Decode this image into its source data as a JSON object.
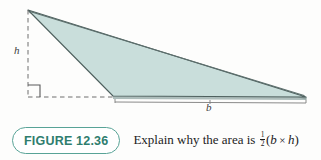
{
  "figure": {
    "type": "geometry-diagram",
    "shape": "obtuse-triangle",
    "fill_color": "#c9dedb",
    "stroke_color": "#4a5a58",
    "shadow_color": "#8fa5a2",
    "background_color": "#fdfdfc",
    "labels": {
      "height": "h",
      "base": "b"
    },
    "annotations": {
      "dashed_height_line": "dashed vertical segment from apex to base line",
      "right_angle_marker": "square marker indicating perpendicular height",
      "base_measure_bracket": "bracket spanning the base labeled b"
    },
    "geometry": {
      "apex": [
        28,
        10
      ],
      "bottom_left": [
        113,
        96
      ],
      "bottom_right": [
        306,
        97
      ],
      "foot_of_height": [
        28,
        97
      ],
      "height_px": 87,
      "base_px": 193
    }
  },
  "caption": {
    "badge_label": "FIGURE 12.36",
    "badge_border_color": "#58a396",
    "badge_text_color": "#2f7d6e",
    "text_before": "Explain why the area is ",
    "fraction_numerator": "1",
    "fraction_denominator": "2",
    "open_paren": "(",
    "var_base": "b",
    "times": "×",
    "var_height": "h",
    "close_paren": ")"
  }
}
